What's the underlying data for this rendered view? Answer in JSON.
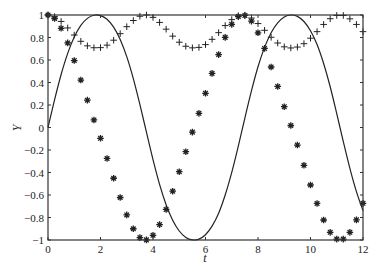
{
  "chart_data": {
    "type": "line",
    "title": "",
    "xlabel": "t",
    "ylabel": "Y",
    "xlim": [
      0,
      12
    ],
    "ylim": [
      -1,
      1
    ],
    "grid": false,
    "legend": null,
    "x_ticks": [
      0,
      2,
      4,
      6,
      8,
      10,
      12
    ],
    "y_ticks": [
      -1,
      -0.8,
      -0.6,
      -0.4,
      -0.2,
      0,
      0.2,
      0.4,
      0.6,
      0.8,
      1
    ],
    "x_tick_labels": [
      "0",
      "2",
      "4",
      "6",
      "8",
      "10",
      "12"
    ],
    "y_tick_labels": [
      "−1",
      "−0.8",
      "−0.6",
      "−0.4",
      "−0.2",
      "0",
      "0.2",
      "0.4",
      "0.6",
      "0.8",
      "1"
    ],
    "x": [
      0,
      0.25,
      0.5,
      0.75,
      1,
      1.25,
      1.5,
      1.75,
      2,
      2.25,
      2.5,
      2.75,
      3,
      3.25,
      3.5,
      3.75,
      4,
      4.25,
      4.5,
      4.75,
      5,
      5.25,
      5.5,
      5.75,
      6,
      6.25,
      6.5,
      6.75,
      7,
      7.25,
      7.5,
      7.75,
      8,
      8.25,
      8.5,
      8.75,
      9,
      9.25,
      9.5,
      9.75,
      10,
      10.25,
      10.5,
      10.75,
      11,
      11.25,
      11.5,
      11.75,
      12
    ],
    "series": [
      {
        "name": "Y1 (solid line)",
        "style": "line",
        "color": "#222222",
        "values": [
          0,
          0.246,
          0.471,
          0.659,
          0.804,
          0.907,
          0.97,
          0.998,
          0.995,
          0.962,
          0.892,
          0.783,
          0.63,
          0.435,
          0.205,
          -0.042,
          -0.286,
          -0.505,
          -0.686,
          -0.824,
          -0.92,
          -0.977,
          -0.999,
          -0.992,
          -0.953,
          -0.877,
          -0.762,
          -0.6,
          -0.399,
          -0.165,
          0.084,
          0.325,
          0.54,
          0.712,
          0.843,
          0.931,
          0.983,
          1.0,
          0.988,
          0.942,
          0.86,
          0.738,
          0.569,
          0.362,
          0.123,
          -0.126,
          -0.363,
          -0.57,
          -0.739
        ]
      },
      {
        "name": "Y2 (asterisk markers)",
        "style": "marker-star",
        "color": "#222222",
        "values": [
          1,
          0.969,
          0.882,
          0.752,
          0.595,
          0.422,
          0.243,
          0.067,
          -0.096,
          -0.275,
          -0.451,
          -0.622,
          -0.777,
          -0.9,
          -0.979,
          -0.999,
          -0.958,
          -0.863,
          -0.728,
          -0.566,
          -0.393,
          -0.215,
          -0.041,
          0.126,
          0.304,
          0.481,
          0.648,
          0.801,
          0.917,
          0.986,
          0.996,
          0.946,
          0.842,
          0.703,
          0.538,
          0.365,
          0.185,
          0.018,
          -0.156,
          -0.336,
          -0.511,
          -0.675,
          -0.822,
          -0.932,
          -0.992,
          -0.992,
          -0.932,
          -0.821,
          -0.674
        ]
      },
      {
        "name": "Y3 (plus markers)",
        "style": "marker-plus",
        "color": "#222222",
        "values": [
          1,
          0.985,
          0.943,
          0.885,
          0.822,
          0.766,
          0.726,
          0.709,
          0.71,
          0.732,
          0.776,
          0.834,
          0.896,
          0.951,
          0.989,
          1.0,
          0.979,
          0.934,
          0.874,
          0.812,
          0.758,
          0.722,
          0.708,
          0.712,
          0.737,
          0.784,
          0.843,
          0.906,
          0.959,
          0.993,
          0.998,
          0.973,
          0.924,
          0.864,
          0.802,
          0.751,
          0.717,
          0.707,
          0.715,
          0.745,
          0.794,
          0.852,
          0.916,
          0.967,
          0.996,
          0.996,
          0.966,
          0.916,
          0.852
        ]
      }
    ]
  }
}
